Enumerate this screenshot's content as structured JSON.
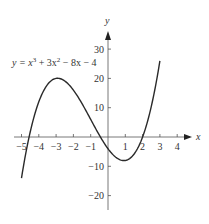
{
  "chart_data": {
    "type": "line",
    "title": "",
    "equation_label": "y = x³ + 3x² − 8x − 4",
    "equation": {
      "prefix": "y = x",
      "sup1": "3",
      "mid": " + 3x",
      "sup2": "2",
      "suffix": " − 8x − 4"
    },
    "xlabel": "x",
    "ylabel": "y",
    "xlim": [
      -5,
      4.5
    ],
    "ylim": [
      -25,
      35
    ],
    "x_ticks": [
      "-5",
      "-4",
      "-3",
      "-2",
      "-1",
      "1",
      "2",
      "3",
      "4"
    ],
    "y_ticks": [
      "30",
      "20",
      "10",
      "-10",
      "-20"
    ],
    "x_tick_labels": [
      "−5",
      "−4",
      "−3",
      "−2",
      "−1",
      "1",
      "2",
      "3",
      "4"
    ],
    "y_tick_labels": [
      "30",
      "20",
      "10",
      "−10",
      "−20"
    ],
    "grid": false,
    "series": [
      {
        "name": "y = x^3 + 3x^2 - 8x - 4",
        "x": [
          -5,
          -4.5,
          -4,
          -3.5,
          -3,
          -2.5,
          -2,
          -1.5,
          -1,
          -0.5,
          0,
          0.5,
          1,
          1.5,
          2,
          2.5,
          3
        ],
        "y": [
          -14,
          3.6,
          12,
          17.4,
          20,
          20.6,
          16,
          12.6,
          6,
          0.4,
          -4,
          -6.4,
          -8,
          -5.9,
          0,
          7.9,
          26
        ]
      }
    ],
    "roots_approx": [
      -4.4,
      -0.4,
      2
    ],
    "local_max": {
      "x": -2.5,
      "y": 20.6
    },
    "local_min": {
      "x": 0.9,
      "y": -8.1
    }
  }
}
